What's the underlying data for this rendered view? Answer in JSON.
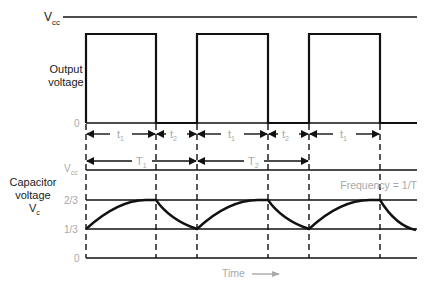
{
  "diagram": {
    "top_panel": {
      "vcc_label": "V",
      "vcc_sub": "cc",
      "ylabel_line1": "Output",
      "ylabel_line2": "voltage",
      "zero_label": "0",
      "intervals": [
        {
          "label": "t",
          "sub": "1"
        },
        {
          "label": "t",
          "sub": "2"
        },
        {
          "label": "t",
          "sub": "1"
        },
        {
          "label": "t",
          "sub": "2"
        },
        {
          "label": "t",
          "sub": "1"
        }
      ]
    },
    "periods": [
      {
        "label": "T",
        "sub": "1"
      },
      {
        "label": "T",
        "sub": "2"
      }
    ],
    "bottom_panel": {
      "ylabel_line1": "Capacitor",
      "ylabel_line2": "voltage",
      "ylabel_line3": "V",
      "ylabel_sub": "c",
      "levels": [
        {
          "label": "V",
          "sub": "cc"
        },
        {
          "label": "2/3",
          "sub": ""
        },
        {
          "label": "1/3",
          "sub": ""
        },
        {
          "label": "0",
          "sub": ""
        }
      ],
      "annotation": "Frequency = 1/T"
    },
    "xaxis_label": "Time",
    "colors": {
      "line": "#111111",
      "label_gray": "#a8a8a8",
      "background": "#ffffff"
    }
  }
}
